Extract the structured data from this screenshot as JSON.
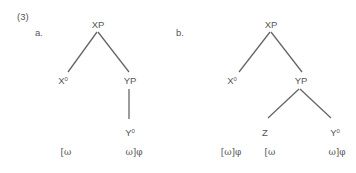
{
  "example_number": "(3)",
  "trees": [
    {
      "label": "a.",
      "nodes": {
        "root": "XP",
        "left": "X",
        "left_sup": "0",
        "right": "YP",
        "right_child": "Y",
        "right_child_sup": "0"
      },
      "phonology": [
        "[ω",
        "ω]φ"
      ]
    },
    {
      "label": "b.",
      "nodes": {
        "root": "XP",
        "left": "X",
        "left_sup": "0",
        "right": "YP",
        "right_left_child": "Z",
        "right_right_child": "Y",
        "right_right_child_sup": "0"
      },
      "phonology": [
        "[ω]φ",
        "[ω",
        "ω]φ"
      ]
    }
  ],
  "colors": {
    "text": "#555555",
    "line": "#666666"
  }
}
